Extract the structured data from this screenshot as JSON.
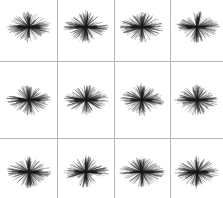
{
  "figure": {
    "width": 223,
    "height": 198,
    "background_color": "#ffffff",
    "title": ""
  },
  "grid": {
    "columns": 4,
    "rows": 3,
    "line_color": "#b8b8b8",
    "line_width": 1,
    "vertical_line_positions": [
      57,
      114,
      170
    ],
    "horizontal_line_positions": [
      61,
      138
    ]
  },
  "chart_data": {
    "type": "scatter",
    "title": "",
    "subtitle": "",
    "xlabel": "",
    "ylabel": "",
    "grid": true,
    "legend_position": "none",
    "layout": {
      "facet_columns": 4,
      "facet_rows": 3,
      "panel_count": 12
    },
    "series": [
      {
        "name": "panel-1",
        "row": 0,
        "col": 0,
        "center_x": 29,
        "center_y": 27,
        "radius_x": 23,
        "radius_y": 15,
        "ray_count": 170,
        "values": []
      },
      {
        "name": "panel-2",
        "row": 0,
        "col": 1,
        "center_x": 86,
        "center_y": 27,
        "radius_x": 23,
        "radius_y": 15,
        "ray_count": 170,
        "values": []
      },
      {
        "name": "panel-3",
        "row": 0,
        "col": 2,
        "center_x": 142,
        "center_y": 27,
        "radius_x": 23,
        "radius_y": 15,
        "ray_count": 170,
        "values": []
      },
      {
        "name": "panel-4",
        "row": 0,
        "col": 3,
        "center_x": 197,
        "center_y": 27,
        "radius_x": 23,
        "radius_y": 15,
        "ray_count": 170,
        "values": []
      },
      {
        "name": "panel-5",
        "row": 1,
        "col": 0,
        "center_x": 29,
        "center_y": 100,
        "radius_x": 23,
        "radius_y": 15,
        "ray_count": 170,
        "values": []
      },
      {
        "name": "panel-6",
        "row": 1,
        "col": 1,
        "center_x": 86,
        "center_y": 100,
        "radius_x": 23,
        "radius_y": 15,
        "ray_count": 170,
        "values": []
      },
      {
        "name": "panel-7",
        "row": 1,
        "col": 2,
        "center_x": 142,
        "center_y": 100,
        "radius_x": 23,
        "radius_y": 15,
        "ray_count": 170,
        "values": []
      },
      {
        "name": "panel-8",
        "row": 1,
        "col": 3,
        "center_x": 197,
        "center_y": 100,
        "radius_x": 23,
        "radius_y": 15,
        "ray_count": 170,
        "values": []
      },
      {
        "name": "panel-9",
        "row": 2,
        "col": 0,
        "center_x": 29,
        "center_y": 172,
        "radius_x": 23,
        "radius_y": 15,
        "ray_count": 170,
        "values": []
      },
      {
        "name": "panel-10",
        "row": 2,
        "col": 1,
        "center_x": 86,
        "center_y": 172,
        "radius_x": 23,
        "radius_y": 15,
        "ray_count": 170,
        "values": []
      },
      {
        "name": "panel-11",
        "row": 2,
        "col": 2,
        "center_x": 142,
        "center_y": 172,
        "radius_x": 23,
        "radius_y": 15,
        "ray_count": 170,
        "values": []
      },
      {
        "name": "panel-12",
        "row": 2,
        "col": 3,
        "center_x": 197,
        "center_y": 172,
        "radius_x": 23,
        "radius_y": 15,
        "ray_count": 170,
        "values": []
      }
    ],
    "ray_color": "#1a1a1a",
    "ray_stroke_width": 0.45
  }
}
